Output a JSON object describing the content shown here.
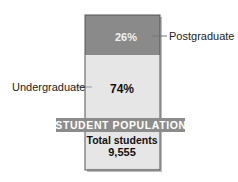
{
  "chart_data": {
    "type": "bar",
    "subtype": "stacked-100",
    "title": "STUDENT POPULATION",
    "categories": [
      "Undergraduate",
      "Postgraduate"
    ],
    "values": [
      74,
      26
    ],
    "value_labels": [
      "74%",
      "26%"
    ],
    "unit": "%",
    "ylim": [
      0,
      100
    ],
    "grid": false,
    "legend": "none",
    "annotations": {
      "total_label": "Total students",
      "total_value": "9,555"
    },
    "colors": {
      "Undergraduate": "#e6e6e6",
      "Postgraduate": "#8a8a8a",
      "banner": "#8c8c8c",
      "banner_text": "#ffffff",
      "border": "#555555"
    }
  }
}
